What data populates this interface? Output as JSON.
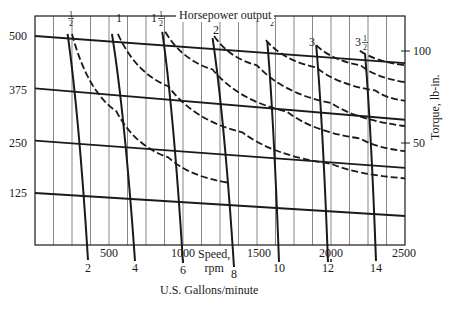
{
  "chart_data": {
    "type": "line",
    "title": "Horsepower output",
    "xlabel": "Speed, rpm",
    "x2label": "U.S. Gallons/minute",
    "ylabel_left": "",
    "ylabel_right": "Torque, lb-in.",
    "xlim": [
      0,
      2500
    ],
    "x_ticks": [
      500,
      1000,
      1500,
      2000,
      2500
    ],
    "x2_ticks": [
      2,
      4,
      6,
      8,
      10,
      12,
      14
    ],
    "y_left_ticks": [
      125,
      250,
      375,
      500
    ],
    "y_right_ticks": [
      50,
      100
    ],
    "grid": {
      "vertical": true,
      "horizontal": false
    },
    "legend": "none",
    "series_pressure_lines": [
      {
        "name": "500",
        "x": [
          0,
          2500
        ],
        "y": [
          500,
          435
        ]
      },
      {
        "name": "375",
        "x": [
          0,
          2500
        ],
        "y": [
          375,
          300
        ]
      },
      {
        "name": "250",
        "x": [
          0,
          2500
        ],
        "y": [
          250,
          185
        ]
      },
      {
        "name": "125",
        "x": [
          0,
          2500
        ],
        "y": [
          125,
          70
        ]
      }
    ],
    "series_horsepower_dashed": [
      {
        "name": "1/2",
        "label": "1/2",
        "x": [
          250,
          550,
          900,
          1300
        ],
        "y": [
          505,
          320,
          210,
          150
        ]
      },
      {
        "name": "1",
        "label": "1",
        "x": [
          560,
          900,
          1400,
          2000,
          2500
        ],
        "y": [
          505,
          380,
          270,
          195,
          160
        ]
      },
      {
        "name": "1 1/2",
        "label": "1 1/2",
        "x": [
          880,
          1200,
          1700,
          2200,
          2500
        ],
        "y": [
          510,
          420,
          320,
          255,
          225
        ]
      },
      {
        "name": "2",
        "label": "2",
        "x": [
          1210,
          1500,
          2000,
          2500
        ],
        "y": [
          500,
          430,
          340,
          285
        ]
      },
      {
        "name": "2 1/2",
        "label": "2 1/2",
        "x": [
          1560,
          1900,
          2300,
          2500
        ],
        "y": [
          490,
          425,
          370,
          345
        ]
      },
      {
        "name": "3",
        "label": "3",
        "x": [
          1900,
          2200,
          2500
        ],
        "y": [
          478,
          430,
          390
        ]
      },
      {
        "name": "3 1/2",
        "label": "3 1/2",
        "x": [
          2195,
          2500
        ],
        "y": [
          465,
          430
        ]
      }
    ],
    "series_flow_solid": [
      {
        "name": "2 gpm",
        "x": [
          220,
          330
        ],
        "y": [
          505,
          -60
        ]
      },
      {
        "name": "4 gpm",
        "x": [
          520,
          620
        ],
        "y": [
          505,
          -60
        ]
      },
      {
        "name": "6 gpm",
        "x": [
          860,
          1000
        ],
        "y": [
          510,
          -60
        ]
      },
      {
        "name": "8 gpm",
        "x": [
          1200,
          1335
        ],
        "y": [
          495,
          -75
        ]
      },
      {
        "name": "10 gpm",
        "x": [
          1570,
          1660
        ],
        "y": [
          485,
          -60
        ]
      },
      {
        "name": "12 gpm",
        "x": [
          1900,
          2000
        ],
        "y": [
          478,
          -60
        ]
      },
      {
        "name": "14 gpm",
        "x": [
          2230,
          2320
        ],
        "y": [
          457,
          -60
        ]
      }
    ]
  },
  "labels": {
    "title": "Horsepower output",
    "speed_line1": "Speed,",
    "speed_line2": "rpm",
    "xlabel": "U.S. Gallons/minute",
    "ylabel_right": "Torque, lb-in.",
    "hp_labels": [
      {
        "text": "1/2",
        "whole": "",
        "num": "1",
        "den": "2",
        "x": 68,
        "y": 22
      },
      {
        "text": "1",
        "whole": "1",
        "num": "",
        "den": "",
        "x": 116,
        "y": 22
      },
      {
        "text": "1 1/2",
        "whole": "1",
        "num": "1",
        "den": "2",
        "x": 151,
        "y": 22
      },
      {
        "text": "2",
        "whole": "2",
        "num": "",
        "den": "",
        "x": 213,
        "y": 34
      },
      {
        "text": "2 1/2",
        "whole": "2",
        "num": "1",
        "den": "2",
        "x": 262,
        "y": 22
      },
      {
        "text": "3",
        "whole": "3",
        "num": "",
        "den": "",
        "x": 309,
        "y": 46
      },
      {
        "text": "3 1/2",
        "whole": "3",
        "num": "1",
        "den": "2",
        "x": 355,
        "y": 46
      }
    ],
    "y_left": [
      "500",
      "375",
      "250",
      "125"
    ],
    "y_right": [
      "100",
      "50"
    ],
    "x_speed": [
      "500",
      "1000",
      "1500",
      "2000",
      "2500"
    ],
    "x_gpm": [
      "2",
      "4",
      "6",
      "8",
      "10",
      "12",
      "14"
    ]
  }
}
